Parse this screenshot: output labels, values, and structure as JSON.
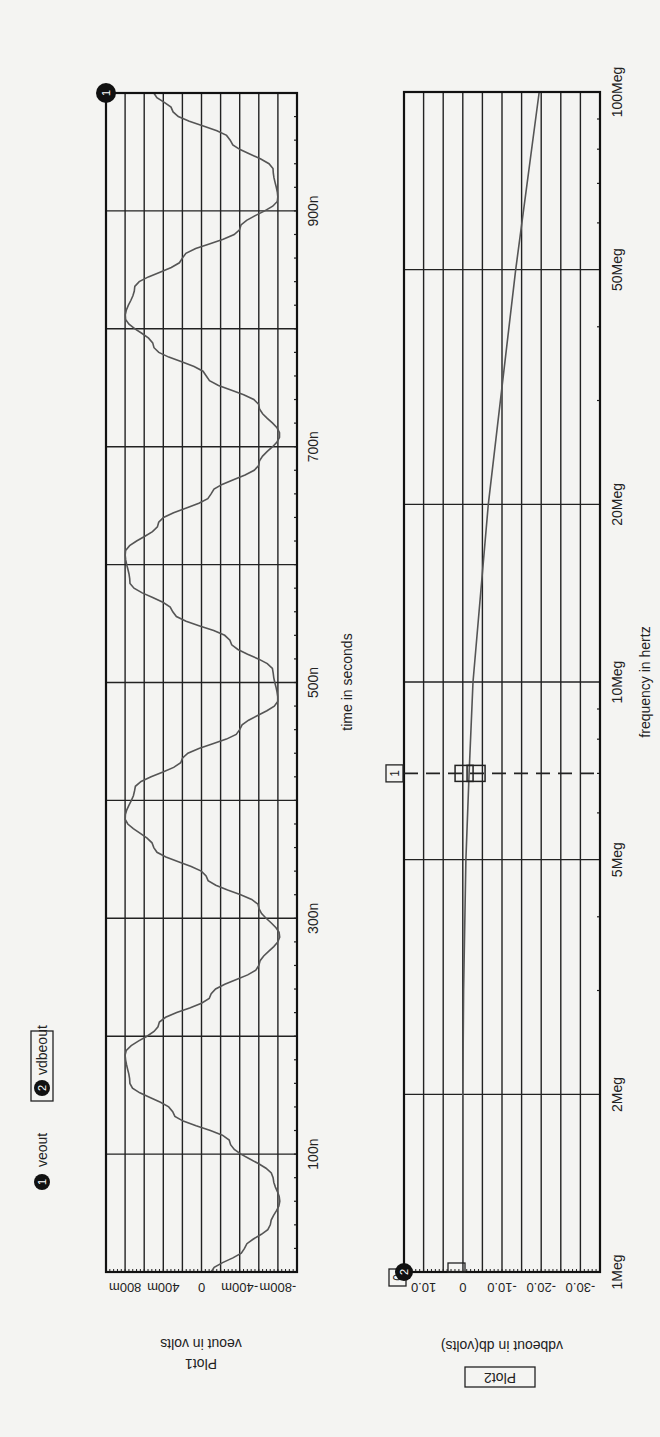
{
  "legend": {
    "items": [
      {
        "index": "1",
        "label": "veout",
        "boxed": false
      },
      {
        "index": "2",
        "label": "vdbeout",
        "boxed": true
      }
    ]
  },
  "plots": [
    {
      "name": "Plot1",
      "boxed_title": false,
      "ylabel": "veout in volts",
      "xlabel": "time in seconds",
      "yticks": [
        "800m",
        "400m",
        "0",
        "-400m",
        "-800m"
      ],
      "xticks": [
        "100n",
        "300n",
        "500n",
        "700n",
        "900n"
      ],
      "trace_marker": "1"
    },
    {
      "name": "Plot2",
      "boxed_title": true,
      "ylabel": "vdbeout in db(volts)",
      "xlabel": "frequency in hertz",
      "yticks": [
        "10.0",
        "0",
        "-10.0",
        "-20.0",
        "-30.0"
      ],
      "xticks": [
        "1Meg",
        "2Meg",
        "5Meg",
        "10Meg",
        "20Meg",
        "50Meg",
        "100Meg"
      ],
      "trace_marker": "2",
      "cursor_marker": "1",
      "origin_marker": "0"
    }
  ],
  "chart_data": [
    {
      "type": "line",
      "title": "Plot1",
      "xlabel": "time in seconds",
      "ylabel": "veout in volts",
      "xlim": [
        0,
        1e-06
      ],
      "ylim": [
        -1.0,
        1.0
      ],
      "grid": true,
      "yticks": [
        "800m",
        "400m",
        "0",
        "-400m",
        "-800m"
      ],
      "xticks": [
        "100n",
        "300n",
        "500n",
        "700n",
        "900n"
      ],
      "series": [
        {
          "name": "veout",
          "x_ns": [
            0,
            20,
            40,
            60,
            80,
            110,
            135,
            160,
            185,
            210,
            235,
            260,
            285,
            310,
            335,
            360,
            385,
            410,
            435,
            460,
            485,
            510,
            535,
            560,
            585,
            610,
            635,
            660,
            685,
            710,
            735,
            760,
            785,
            810,
            835,
            860,
            885,
            910,
            935,
            960,
            985,
            1000
          ],
          "y_volts": [
            -0.1,
            -0.45,
            -0.72,
            -0.82,
            -0.75,
            -0.3,
            0.3,
            0.75,
            0.8,
            0.45,
            -0.1,
            -0.6,
            -0.82,
            -0.6,
            -0.05,
            0.5,
            0.8,
            0.7,
            0.2,
            -0.4,
            -0.8,
            -0.75,
            -0.3,
            0.3,
            0.75,
            0.8,
            0.45,
            -0.1,
            -0.6,
            -0.82,
            -0.6,
            -0.05,
            0.5,
            0.8,
            0.7,
            0.2,
            -0.4,
            -0.8,
            -0.75,
            -0.3,
            0.3,
            0.5
          ]
        }
      ]
    },
    {
      "type": "line",
      "title": "Plot2",
      "xlabel": "frequency in hertz",
      "ylabel": "vdbeout in db(volts)",
      "xscale": "log",
      "xlim": [
        1000000.0,
        100000000.0
      ],
      "ylim": [
        -35,
        15
      ],
      "grid": true,
      "yticks": [
        "10.0",
        "0",
        "-10.0",
        "-20.0",
        "-30.0"
      ],
      "xticks": [
        "1Meg",
        "2Meg",
        "5Meg",
        "10Meg",
        "20Meg",
        "50Meg",
        "100Meg"
      ],
      "series": [
        {
          "name": "vdbeout",
          "x_hz": [
            1000000.0,
            2000000.0,
            3000000.0,
            5000000.0,
            7000000.0,
            10000000.0,
            20000000.0,
            50000000.0,
            100000000.0
          ],
          "y_db": [
            0.0,
            0.0,
            -0.2,
            -0.8,
            -1.6,
            -2.6,
            -6.5,
            -13.5,
            -19.5
          ]
        }
      ],
      "cursor": {
        "label": "1",
        "x_hz": 7000000.0
      }
    }
  ]
}
